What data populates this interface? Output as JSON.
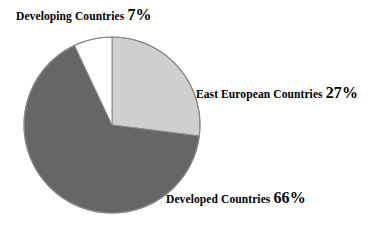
{
  "chart_data": {
    "type": "pie",
    "title": "",
    "subtitle": "",
    "xlabel": "",
    "ylabel": "",
    "legend_position": "none",
    "grid": false,
    "labels_inline": true,
    "unit": "%",
    "categories": [
      "Developing Countries",
      "East European Countries",
      "Developed Countries"
    ],
    "values": [
      7,
      27,
      66
    ],
    "slices": [
      {
        "name": "East European Countries",
        "label": "East European Countries",
        "value": 27,
        "percent_text": "27%",
        "color": "#cfcfcf",
        "start_angle_deg": 0,
        "end_angle_deg": 97.2
      },
      {
        "name": "Developed Countries",
        "label": "Developed Countries",
        "value": 66,
        "percent_text": "66%",
        "color": "#666666",
        "start_angle_deg": 97.2,
        "end_angle_deg": 334.8
      },
      {
        "name": "Developing Countries",
        "label": "Developing Countries",
        "value": 7,
        "percent_text": "7%",
        "color": "#ffffff",
        "start_angle_deg": 334.8,
        "end_angle_deg": 360
      }
    ],
    "geometry": {
      "center_x": 112,
      "center_y": 125,
      "radius": 88,
      "start_at_12_oclock": true,
      "direction": "clockwise"
    },
    "colors": {
      "background": "#ffffff",
      "outline": "#8a8a8a",
      "text": "#000000",
      "slice_light_gray": "#cfcfcf",
      "slice_dark_gray": "#666666",
      "slice_white": "#ffffff"
    }
  },
  "labels": {
    "developing": {
      "text": "Developing Countries",
      "percent": "7%"
    },
    "east_european": {
      "text": "East European Countries",
      "percent": "27%"
    },
    "developed": {
      "text": "Developed Countries",
      "percent": "66%"
    }
  }
}
